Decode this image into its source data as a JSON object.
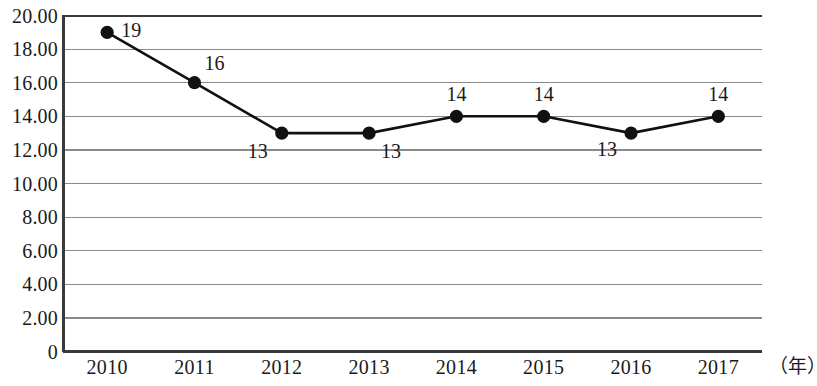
{
  "chart_data": {
    "type": "line",
    "title": "",
    "subtitle": "",
    "xlabel": "（年）",
    "ylabel": "",
    "categories": [
      "2010",
      "2011",
      "2012",
      "2013",
      "2014",
      "2015",
      "2016",
      "2017"
    ],
    "values": [
      19,
      16,
      13,
      13,
      14,
      14,
      13,
      14
    ],
    "point_labels": [
      "19",
      "16",
      "13",
      "13",
      "14",
      "14",
      "13",
      "14"
    ],
    "series": [
      {
        "name": "",
        "values": [
          19,
          16,
          13,
          13,
          14,
          14,
          13,
          14
        ]
      }
    ],
    "ylim": [
      0,
      20
    ],
    "ytick_step": 2,
    "ytick_labels": [
      "20.00",
      "18.00",
      "16.00",
      "14.00",
      "12.00",
      "10.00",
      "8.00",
      "6.00",
      "4.00",
      "2.00",
      "0"
    ],
    "ytick_values": [
      20,
      18,
      16,
      14,
      12,
      10,
      8,
      6,
      4,
      2,
      0
    ],
    "grid": true,
    "grid_orientation": "horizontal",
    "legend": "none",
    "marker": "filled-circle",
    "line_color": "#111111",
    "marker_color": "#111111",
    "grid_color": "#8a8a8a",
    "axis_color": "#3a3a3a",
    "background": "#ffffff",
    "label_offsets": [
      {
        "dx": 14,
        "dy": -2,
        "align": "left"
      },
      {
        "dx": 10,
        "dy": -20,
        "align": "left"
      },
      {
        "dx": -14,
        "dy": 18,
        "align": "right"
      },
      {
        "dx": 12,
        "dy": 18,
        "align": "left"
      },
      {
        "dx": 0,
        "dy": -22,
        "align": "center"
      },
      {
        "dx": 0,
        "dy": -22,
        "align": "center"
      },
      {
        "dx": -14,
        "dy": 16,
        "align": "right"
      },
      {
        "dx": 0,
        "dy": -22,
        "align": "center"
      }
    ]
  },
  "axes": {
    "y_axis_name": "value-axis",
    "x_axis_name": "year-axis",
    "x_unit_label": "（年）"
  }
}
